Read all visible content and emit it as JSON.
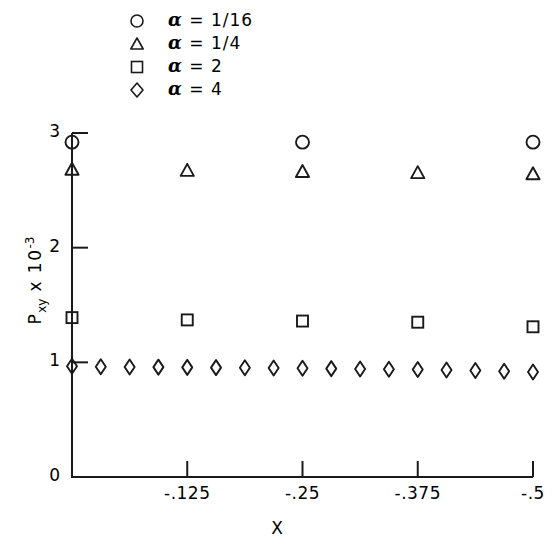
{
  "chart_data": {
    "type": "scatter",
    "title": "",
    "xlabel": "X",
    "ylabel": "P",
    "ylabel_sub": "xy",
    "ylabel_mult": " x 10",
    "ylabel_exp": "-3",
    "xlim": [
      0,
      -0.5
    ],
    "ylim": [
      0,
      3
    ],
    "grid": false,
    "legend_position": "top-center",
    "x_ticks": [
      {
        "value": -0.125,
        "label": "-.125"
      },
      {
        "value": -0.25,
        "label": "-.25"
      },
      {
        "value": -0.375,
        "label": "-.375"
      },
      {
        "value": -0.5,
        "label": "-.5"
      }
    ],
    "y_ticks": [
      {
        "value": 0,
        "label": "0"
      },
      {
        "value": 1,
        "label": "1"
      },
      {
        "value": 2,
        "label": "2"
      },
      {
        "value": 3,
        "label": "3"
      }
    ],
    "series": [
      {
        "name": "alpha-1-16",
        "legend_label": "= 1/16",
        "legend_symbol": "α",
        "marker": "circle",
        "x": [
          0.0,
          -0.25,
          -0.5
        ],
        "y": [
          2.92,
          2.92,
          2.92
        ]
      },
      {
        "name": "alpha-1-4",
        "legend_label": "= 1/4",
        "legend_symbol": "α",
        "marker": "triangle",
        "x": [
          0.0,
          -0.125,
          -0.25,
          -0.375,
          -0.5
        ],
        "y": [
          2.68,
          2.67,
          2.66,
          2.65,
          2.64
        ]
      },
      {
        "name": "alpha-2",
        "legend_label": "= 2",
        "legend_symbol": "α",
        "marker": "square",
        "x": [
          0.0,
          -0.125,
          -0.25,
          -0.375,
          -0.5
        ],
        "y": [
          1.39,
          1.37,
          1.36,
          1.35,
          1.31
        ]
      },
      {
        "name": "alpha-4",
        "legend_label": "= 4",
        "legend_symbol": "α",
        "marker": "diamond",
        "x": [
          0.0,
          -0.0312,
          -0.0625,
          -0.0937,
          -0.125,
          -0.1562,
          -0.1875,
          -0.2187,
          -0.25,
          -0.2812,
          -0.3125,
          -0.3437,
          -0.375,
          -0.4062,
          -0.4375,
          -0.4687,
          -0.5
        ],
        "y": [
          0.965,
          0.962,
          0.96,
          0.958,
          0.956,
          0.954,
          0.952,
          0.95,
          0.948,
          0.945,
          0.942,
          0.94,
          0.937,
          0.933,
          0.928,
          0.922,
          0.916
        ]
      }
    ]
  },
  "legend": {
    "items": [
      {
        "marker": "circle",
        "text": "= 1/16"
      },
      {
        "marker": "triangle",
        "text": "= 1/4"
      },
      {
        "marker": "square",
        "text": "= 2"
      },
      {
        "marker": "diamond",
        "text": "= 4"
      }
    ],
    "symbol": "α"
  },
  "axes": {
    "x_title": "X",
    "y_title_base": "P",
    "y_title_sub": "xy",
    "y_title_mid": " x 10",
    "y_title_exp": "-3"
  },
  "colors": {
    "ink": "#1a1a1a",
    "background": "#ffffff"
  }
}
